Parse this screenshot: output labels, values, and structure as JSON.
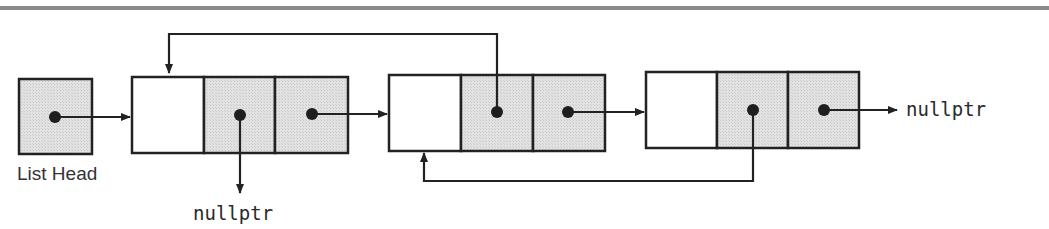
{
  "diagram": {
    "colors": {
      "top_rule": "#8a8a8a",
      "line": "#222222",
      "shaded_cell": "#dcdcdc",
      "empty_cell": "#ffffff",
      "dot": "#1e1e1e"
    },
    "list_head": {
      "label": "List Head"
    },
    "nodes": [
      {
        "id": "node-1",
        "cells": [
          "data",
          "prev",
          "next"
        ],
        "prev_target": "nullptr",
        "next_target": "node-2"
      },
      {
        "id": "node-2",
        "cells": [
          "data",
          "prev",
          "next"
        ],
        "prev_target": "node-1",
        "next_target": "node-3"
      },
      {
        "id": "node-3",
        "cells": [
          "data",
          "prev",
          "next"
        ],
        "prev_target": "node-2",
        "next_target": "nullptr"
      }
    ],
    "null_labels": {
      "node1_prev": "nullptr",
      "node3_next": "nullptr"
    }
  }
}
